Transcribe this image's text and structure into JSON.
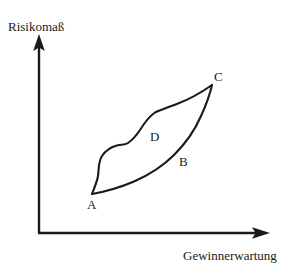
{
  "figure": {
    "type": "diagram",
    "background_color": "#ffffff",
    "stroke_color": "#1a1a1a",
    "axes": {
      "y_label": "Risikomaß",
      "x_label": "Gewinnerwartung",
      "y_axis_arrow": "up-arrow-icon",
      "x_axis_arrow": "right-arrow-icon",
      "origin": {
        "x": 39,
        "y": 233
      },
      "y_axis_tip": {
        "x": 39,
        "y": 36
      },
      "x_axis_tip": {
        "x": 268,
        "y": 233
      },
      "ticks": [],
      "gridlines": false
    },
    "region": {
      "name": "lens-shaped-region",
      "filled": false,
      "vertices": {
        "A": {
          "x": 92,
          "y": 194
        },
        "C": {
          "x": 212,
          "y": 85
        }
      },
      "upper_boundary_points": [
        {
          "x": 92,
          "y": 194
        },
        {
          "x": 98,
          "y": 178
        },
        {
          "x": 99,
          "y": 166
        },
        {
          "x": 104,
          "y": 155
        },
        {
          "x": 114,
          "y": 146
        },
        {
          "x": 126,
          "y": 144
        },
        {
          "x": 138,
          "y": 133
        },
        {
          "x": 150,
          "y": 116
        },
        {
          "x": 156,
          "y": 112
        },
        {
          "x": 175,
          "y": 104
        },
        {
          "x": 196,
          "y": 94
        },
        {
          "x": 212,
          "y": 85
        }
      ],
      "lower_boundary_points": [
        {
          "x": 92,
          "y": 194
        },
        {
          "x": 118,
          "y": 187
        },
        {
          "x": 145,
          "y": 175
        },
        {
          "x": 170,
          "y": 160
        },
        {
          "x": 190,
          "y": 140
        },
        {
          "x": 203,
          "y": 116
        },
        {
          "x": 212,
          "y": 85
        }
      ]
    },
    "point_labels": [
      {
        "id": "A",
        "text": "A",
        "x": 87,
        "y": 198,
        "position": "below-left-vertex"
      },
      {
        "id": "B",
        "text": "B",
        "x": 179,
        "y": 155,
        "position": "inside-lower"
      },
      {
        "id": "C",
        "text": "C",
        "x": 214,
        "y": 70,
        "position": "above-right-vertex"
      },
      {
        "id": "D",
        "text": "D",
        "x": 150,
        "y": 130,
        "position": "inside-upper"
      }
    ]
  }
}
